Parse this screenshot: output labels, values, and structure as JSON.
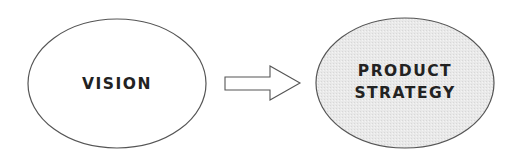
{
  "diagram": {
    "type": "flow",
    "nodes": [
      {
        "id": "vision",
        "label": "VISION",
        "fill": "#ffffff",
        "stroke": "#555555"
      },
      {
        "id": "product-strategy",
        "label_lines": [
          "PRODUCT",
          "STRATEGY"
        ],
        "fill": "#e6e6e6",
        "stroke": "#555555"
      }
    ],
    "edges": [
      {
        "from": "vision",
        "to": "product-strategy",
        "style": "hollow-block-arrow"
      }
    ]
  }
}
